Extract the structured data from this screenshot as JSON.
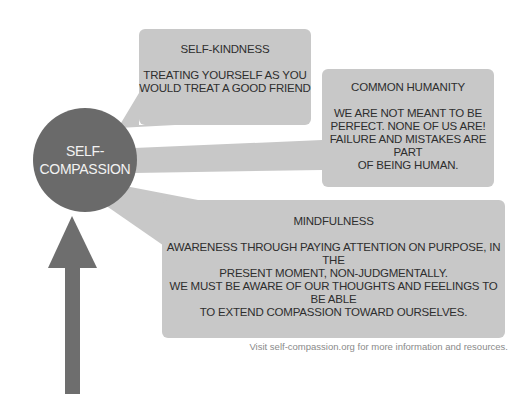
{
  "colors": {
    "circle": "#6a6a6a",
    "box": "#c8c8c8",
    "arrow": "#6e6e6e",
    "text_dark": "#2e2e2e",
    "text_light": "#f2f2f2",
    "footer_text": "#8a8a8a"
  },
  "center": {
    "label": "SELF-\nCOMPASSION"
  },
  "boxes": [
    {
      "title": "SELF-KINDNESS",
      "body": "TREATING YOURSELF AS YOU\nWOULD TREAT A GOOD FRIEND"
    },
    {
      "title": "COMMON HUMANITY",
      "body": "WE ARE NOT MEANT TO BE\nPERFECT. NONE OF US ARE!\nFAILURE AND MISTAKES ARE PART\nOF BEING HUMAN."
    },
    {
      "title": "MINDFULNESS",
      "body": "AWARENESS THROUGH PAYING ATTENTION ON PURPOSE, IN THE\nPRESENT MOMENT, NON-JUDGMENTALLY.\nWE MUST BE AWARE OF OUR THOUGHTS AND FEELINGS TO BE ABLE\nTO EXTEND COMPASSION TOWARD OURSELVES."
    }
  ],
  "footer": "Visit self-compassion.org for more information and resources.",
  "arrow": {
    "direction": "up"
  }
}
